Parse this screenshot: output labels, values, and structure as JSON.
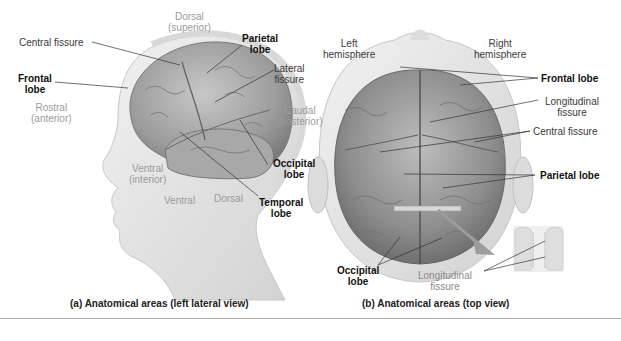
{
  "figure": {
    "panel_a": {
      "caption": "(a) Anatomical areas (left lateral view)",
      "directions": {
        "dorsal_top": [
          "Dorsal",
          "(superior)"
        ],
        "rostral": [
          "Rostral",
          "(anterior)"
        ],
        "caudal": [
          "Caudal",
          "(posterior)"
        ],
        "ventral_inferior": [
          "Ventral",
          "(interior)"
        ],
        "ventral": "Ventral",
        "dorsal_neck": "Dorsal"
      },
      "labels": {
        "central_fissure": "Central fissure",
        "parietal_lobe": [
          "Parietal",
          "lobe"
        ],
        "frontal_lobe": [
          "Frontal",
          "lobe"
        ],
        "lateral_fissure": [
          "Lateral",
          "fissure"
        ],
        "occipital_lobe": [
          "Occipital",
          "lobe"
        ],
        "temporal_lobe": [
          "Temporal",
          "lobe"
        ]
      }
    },
    "panel_b": {
      "caption": "(b) Anatomical areas (top view)",
      "labels": {
        "left_hemisphere": [
          "Left",
          "hemisphere"
        ],
        "right_hemisphere": [
          "Right",
          "hemisphere"
        ],
        "frontal_lobe": "Frontal lobe",
        "longitudinal_fissure": [
          "Longitudinal",
          "fissure"
        ],
        "central_fissure": "Central fissure",
        "parietal_lobe": "Parietal lobe",
        "occipital_lobe": [
          "Occipital",
          "lobe"
        ],
        "longitudinal_fissure_inset": [
          "Longitudinal",
          "fissure"
        ]
      }
    },
    "colors": {
      "brain": "#9a9a9a",
      "skin": "#e6e6e6",
      "skull_outline": "#d4d4d4",
      "label_dark": "#111111",
      "label_light": "#9a9a9a"
    }
  }
}
